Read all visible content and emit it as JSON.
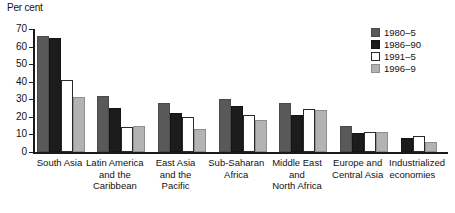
{
  "chart_data": {
    "type": "bar",
    "title": "",
    "xlabel": "",
    "ylabel": "Per cent",
    "ylim": [
      0,
      70
    ],
    "yticks": [
      0,
      10,
      20,
      30,
      40,
      50,
      60,
      70
    ],
    "ytick_labels": [
      "0",
      "10",
      "20",
      "30",
      "40",
      "50",
      "60",
      "70"
    ],
    "grid": false,
    "legend_position": "top-right",
    "categories": [
      "South Asia",
      "Latin America\nand the\nCaribbean",
      "East Asia\nand the\nPacific",
      "Sub-Saharan\nAfrica",
      "Middle East\nand\nNorth Africa",
      "Europe and\nCentral Asia",
      "Industrialized\neconomies"
    ],
    "series": [
      {
        "name": "1980–5",
        "color": "#595959",
        "values": [
          66,
          32,
          28,
          30,
          28,
          15,
          0
        ]
      },
      {
        "name": "1986–90",
        "color": "#1c1c1c",
        "values": [
          65,
          25,
          22,
          26,
          21,
          11,
          8
        ]
      },
      {
        "name": "1991–5",
        "color": "#ffffff",
        "values": [
          41,
          14,
          20,
          21,
          24.5,
          11.5,
          9
        ]
      },
      {
        "name": "1996–9",
        "color": "#b3b3b3",
        "values": [
          31.5,
          15,
          13,
          18.5,
          24,
          11.5,
          5.5
        ]
      }
    ]
  },
  "legend": {
    "items": [
      {
        "label": "1980–5"
      },
      {
        "label": "1986–90"
      },
      {
        "label": "1991–5"
      },
      {
        "label": "1996–9"
      }
    ]
  }
}
